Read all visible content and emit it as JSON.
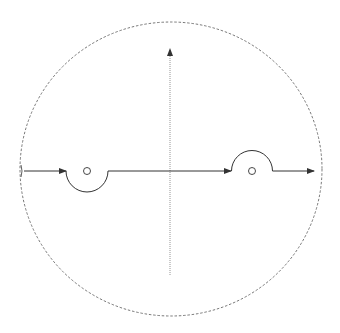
{
  "diagram": {
    "type": "nyquist-contour",
    "colors": {
      "background": "#ffffff",
      "contour": "#333333",
      "boundary": "#555555",
      "axis": "#888888"
    },
    "boundary_circle": {
      "cx": 171,
      "cy": 169,
      "rx": 151,
      "ry": 147,
      "style": "dashed"
    },
    "real_axis_y": 171,
    "imag_axis": {
      "x": 170,
      "y_top": 48,
      "y_bottom": 275,
      "style": "dotted",
      "arrow": "up"
    },
    "indentations": [
      {
        "name": "left-pole-indent",
        "cx": 87,
        "cy": 171,
        "r": 21,
        "direction": "below"
      },
      {
        "name": "right-pole-indent",
        "cx": 252,
        "cy": 171,
        "r": 20.5,
        "direction": "above"
      }
    ],
    "poles": [
      {
        "cx": 87,
        "cy": 171,
        "r": 3.5
      },
      {
        "cx": 252,
        "cy": 171,
        "r": 3.5
      }
    ],
    "arrows": [
      {
        "x": 66,
        "y": 171,
        "direction": "right"
      },
      {
        "x": 230,
        "y": 171,
        "direction": "right"
      },
      {
        "x": 313,
        "y": 171,
        "direction": "right"
      }
    ]
  }
}
